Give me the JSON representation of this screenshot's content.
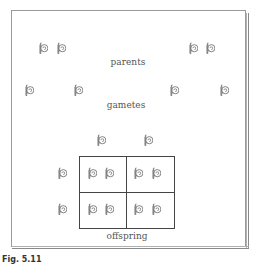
{
  "labels": {
    "parents": "parents",
    "gametes": "gametes",
    "offspring": "offspring"
  },
  "caption": "Fig. 5.11",
  "icons": {
    "shape": "coiled-snail-shell-icon",
    "stroke_color": "#777777"
  },
  "parents": {
    "left": {
      "count": 2
    },
    "right": {
      "count": 2
    }
  },
  "gametes": {
    "count": 4
  },
  "punnett_square": {
    "top_gametes": 2,
    "side_gametes": 2,
    "cells": [
      [
        "2 shells",
        "2 shells"
      ],
      [
        "2 shells",
        "2 shells"
      ]
    ]
  }
}
